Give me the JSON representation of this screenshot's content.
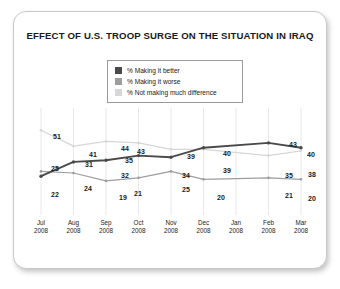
{
  "card": {
    "title": "EFFECT OF U.S. TROOP SURGE ON THE SITUATION IN IRAQ"
  },
  "legend": {
    "items": [
      {
        "label": "% Making it better",
        "color": "#4a4a4a"
      },
      {
        "label": "% Making it worse",
        "color": "#9e9e9e"
      },
      {
        "label": "% Not making much difference",
        "color": "#d6d6d6"
      }
    ]
  },
  "chart_data": {
    "type": "line",
    "title": "EFFECT OF U.S. TROOP SURGE ON THE SITUATION IN IRAQ",
    "xlabel": "",
    "ylabel": "",
    "ylim": [
      0,
      60
    ],
    "grid": "vertical",
    "legend_position": "top-center",
    "categories": [
      "Jul 2008",
      "Aug 2008",
      "Sep 2008",
      "Oct 2008",
      "Nov 2008",
      "Dec 2008",
      "Jan 2008",
      "Feb 2008",
      "Mar 2008"
    ],
    "tick_labels": [
      {
        "month": "Jul",
        "year": "2008"
      },
      {
        "month": "Aug",
        "year": "2008"
      },
      {
        "month": "Sep",
        "year": "2008"
      },
      {
        "month": "Oct",
        "year": "2008"
      },
      {
        "month": "Nov",
        "year": "2008"
      },
      {
        "month": "Dec",
        "year": "2008"
      },
      {
        "month": "Jan",
        "year": "2008"
      },
      {
        "month": "Feb",
        "year": "2008"
      },
      {
        "month": "Mar",
        "year": "2008"
      }
    ],
    "series": [
      {
        "name": "% Making it better",
        "color": "#4a4a4a",
        "values": [
          22,
          31,
          32,
          35,
          34,
          40,
          null,
          43,
          40
        ]
      },
      {
        "name": "% Making it worse",
        "color": "#9e9e9e",
        "values": [
          25,
          24,
          19,
          21,
          25,
          20,
          null,
          21,
          20
        ]
      },
      {
        "name": "% Not making much difference",
        "color": "#d6d6d6",
        "values": [
          51,
          41,
          44,
          43,
          39,
          39,
          null,
          35,
          38
        ]
      }
    ]
  },
  "data_labels": [
    {
      "text": "51",
      "x": 26,
      "y": 25
    },
    {
      "text": "41",
      "x": 62,
      "y": 43
    },
    {
      "text": "44",
      "x": 94,
      "y": 37
    },
    {
      "text": "43",
      "x": 110,
      "y": 40
    },
    {
      "text": "39",
      "x": 160,
      "y": 45
    },
    {
      "text": "40",
      "x": 196,
      "y": 42
    },
    {
      "text": "39",
      "x": 196,
      "y": 59
    },
    {
      "text": "43",
      "x": 262,
      "y": 33
    },
    {
      "text": "40",
      "x": 280,
      "y": 43
    },
    {
      "text": "35",
      "x": 258,
      "y": 64
    },
    {
      "text": "38",
      "x": 281,
      "y": 63
    },
    {
      "text": "25",
      "x": 24,
      "y": 57
    },
    {
      "text": "22",
      "x": 24,
      "y": 83
    },
    {
      "text": "31",
      "x": 58,
      "y": 53
    },
    {
      "text": "24",
      "x": 57,
      "y": 77
    },
    {
      "text": "32",
      "x": 94,
      "y": 64
    },
    {
      "text": "35",
      "x": 98,
      "y": 49
    },
    {
      "text": "19",
      "x": 92,
      "y": 86
    },
    {
      "text": "21",
      "x": 107,
      "y": 82
    },
    {
      "text": "34",
      "x": 155,
      "y": 64
    },
    {
      "text": "25",
      "x": 155,
      "y": 78
    },
    {
      "text": "20",
      "x": 190,
      "y": 86
    },
    {
      "text": "21",
      "x": 258,
      "y": 84
    },
    {
      "text": "20",
      "x": 281,
      "y": 87
    }
  ]
}
